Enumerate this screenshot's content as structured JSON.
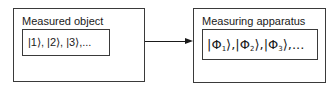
{
  "diagram": {
    "left_box": {
      "title": "Measured object",
      "states_text": "|1⟩, |2⟩, |3⟩,..."
    },
    "right_box": {
      "title": "Measuring apparatus",
      "states": [
        {
          "symbol": "Φ",
          "index": "1"
        },
        {
          "symbol": "Φ",
          "index": "2"
        },
        {
          "symbol": "Φ",
          "index": "3"
        }
      ],
      "trailing": ",..."
    },
    "arrow": {
      "from": "Measured object",
      "to": "Measuring apparatus"
    }
  }
}
